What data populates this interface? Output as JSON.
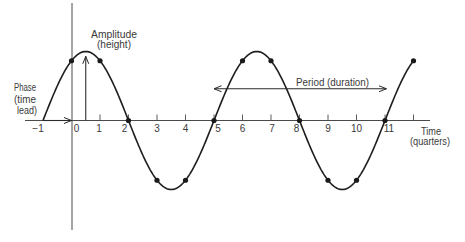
{
  "figure": {
    "annotations": {
      "amplitude": {
        "line1": "Amplitude",
        "line2": "(height)"
      },
      "phase": {
        "line1": "Phase",
        "line2": "(time",
        "line3": "lead)"
      },
      "period": {
        "label": "Period (duration)"
      }
    },
    "x_axis": {
      "title": "Time",
      "subtitle": "(quarters)"
    }
  },
  "chart_data": {
    "type": "line",
    "title": "",
    "xlabel": "Time (quarters)",
    "ylabel": "",
    "xlim": [
      -1,
      12
    ],
    "grid": false,
    "legend": null,
    "x_ticks": [
      1,
      2,
      3,
      4,
      5,
      6,
      7,
      8,
      9,
      10,
      11,
      12
    ],
    "tick_labels": [
      {
        "value": -1,
        "text": "−1",
        "dx": -5
      },
      {
        "value": 0,
        "text": "0",
        "dx": 5
      },
      {
        "value": 1,
        "text": "1",
        "dx": -1
      },
      {
        "value": 2,
        "text": "2",
        "dx": -4
      },
      {
        "value": 3,
        "text": "3",
        "dx": 0
      },
      {
        "value": 4,
        "text": "4",
        "dx": 0
      },
      {
        "value": 5,
        "text": "5",
        "dx": 4
      },
      {
        "value": 6,
        "text": "6",
        "dx": 0
      },
      {
        "value": 7,
        "text": "7",
        "dx": 1
      },
      {
        "value": 8,
        "text": "8",
        "dx": -3
      },
      {
        "value": 9,
        "text": "9",
        "dx": 0
      },
      {
        "value": 10,
        "text": "10",
        "dx": 0
      },
      {
        "value": 11,
        "text": "11",
        "dx": 4
      }
    ],
    "wave": {
      "shape": "sine",
      "amplitude": 1,
      "period": 6,
      "zero_crossing_up": -1,
      "t_start": -1,
      "t_end": 12
    },
    "series": [
      {
        "name": "cycle",
        "x": [
          -1,
          0,
          1,
          2,
          3,
          4,
          5,
          6,
          7,
          8,
          9,
          10,
          11,
          12
        ],
        "values": [
          0,
          0.87,
          0.87,
          0,
          -0.87,
          -0.87,
          0,
          0.87,
          0.87,
          0,
          -0.87,
          -0.87,
          0,
          0.87
        ]
      }
    ],
    "marked_points": [
      0,
      1,
      2,
      3,
      4,
      5,
      6,
      7,
      8,
      9,
      10,
      11,
      12
    ],
    "annotations": [
      {
        "name": "phase",
        "text": "Phase (time lead)",
        "arrow_from": [
          -1,
          0
        ],
        "arrow_to": [
          0,
          0
        ],
        "heads": "end"
      },
      {
        "name": "amplitude",
        "text": "Amplitude (height)",
        "arrow_from": [
          0.5,
          0
        ],
        "arrow_to": [
          0.5,
          0.93
        ],
        "heads": "end"
      },
      {
        "name": "period",
        "text": "Period (duration)",
        "arrow_from": [
          5,
          0.46
        ],
        "arrow_to": [
          11.05,
          0.46
        ],
        "heads": "both"
      }
    ]
  }
}
